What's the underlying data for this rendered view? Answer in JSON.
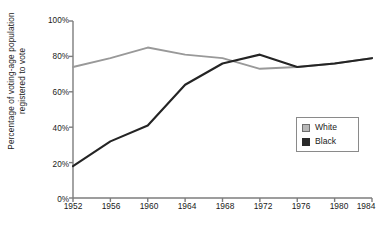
{
  "chart_data": {
    "type": "line",
    "title": "",
    "xlabel": "",
    "ylabel": "Percentage of voting-age population\nregistered to vote",
    "x": [
      1952,
      1956,
      1960,
      1964,
      1968,
      1972,
      1976,
      1980,
      1984
    ],
    "xtick_labels": [
      "1952",
      "1956",
      "1960",
      "1964",
      "1968",
      "1972",
      "1976",
      "1980",
      "1984"
    ],
    "ytick_labels": [
      "0%",
      "20%",
      "40%",
      "60%",
      "80%",
      "100%"
    ],
    "ytick_values": [
      0,
      20,
      40,
      60,
      80,
      100
    ],
    "ylim": [
      0,
      100
    ],
    "xlim": [
      1952,
      1984
    ],
    "grid": false,
    "legend_position": "center-right",
    "series": [
      {
        "name": "White",
        "color": "#999999",
        "values": [
          74,
          79,
          85,
          81,
          79,
          73,
          74,
          76,
          79
        ]
      },
      {
        "name": "Black",
        "color": "#242424",
        "values": [
          18,
          32,
          41,
          64,
          76,
          81,
          74,
          76,
          79
        ]
      }
    ],
    "axis_color": "#7d7d7d"
  },
  "legend": {
    "entries": [
      {
        "label": "White"
      },
      {
        "label": "Black"
      }
    ]
  }
}
